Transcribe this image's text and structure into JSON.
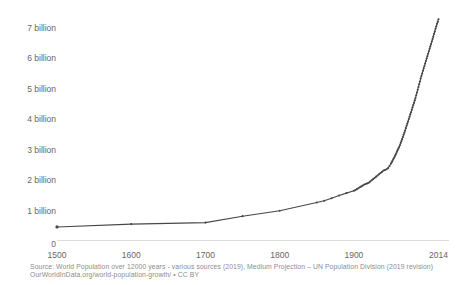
{
  "chart_data": {
    "type": "line",
    "title": "",
    "xlabel": "",
    "ylabel": "",
    "x_range": [
      1500,
      2014
    ],
    "y_range": [
      0,
      7.5
    ],
    "grid": false,
    "legend": "none",
    "line_color": "#474747",
    "marker_color": "#474747",
    "axis_line_color": "#dcdcdc",
    "tick_label_color": "#666666",
    "x": [
      1500,
      1600,
      1700,
      1750,
      1800,
      1850,
      1860,
      1870,
      1880,
      1890,
      1900,
      1902,
      1904,
      1906,
      1908,
      1910,
      1912,
      1914,
      1916,
      1918,
      1920,
      1922,
      1924,
      1926,
      1928,
      1930,
      1932,
      1934,
      1936,
      1938,
      1940,
      1942,
      1944,
      1946,
      1948,
      1950,
      1951,
      1952,
      1953,
      1954,
      1955,
      1956,
      1957,
      1958,
      1959,
      1960,
      1961,
      1962,
      1963,
      1964,
      1965,
      1966,
      1967,
      1968,
      1969,
      1970,
      1971,
      1972,
      1973,
      1974,
      1975,
      1976,
      1977,
      1978,
      1979,
      1980,
      1981,
      1982,
      1983,
      1984,
      1985,
      1986,
      1987,
      1988,
      1989,
      1990,
      1991,
      1992,
      1993,
      1994,
      1995,
      1996,
      1997,
      1998,
      1999,
      2000,
      2001,
      2002,
      2003,
      2004,
      2005,
      2006,
      2007,
      2008,
      2009,
      2010,
      2011,
      2012,
      2013,
      2014
    ],
    "series": [
      {
        "name": "World population (billions)",
        "values": [
          0.461,
          0.554,
          0.603,
          0.814,
          0.99,
          1.263,
          1.32,
          1.4,
          1.49,
          1.57,
          1.65,
          1.67,
          1.7,
          1.73,
          1.76,
          1.79,
          1.82,
          1.85,
          1.87,
          1.89,
          1.91,
          1.95,
          1.99,
          2.03,
          2.07,
          2.11,
          2.15,
          2.19,
          2.23,
          2.27,
          2.31,
          2.33,
          2.35,
          2.39,
          2.46,
          2.54,
          2.58,
          2.63,
          2.68,
          2.72,
          2.77,
          2.82,
          2.87,
          2.93,
          2.98,
          3.03,
          3.08,
          3.14,
          3.21,
          3.27,
          3.34,
          3.41,
          3.48,
          3.55,
          3.62,
          3.7,
          3.78,
          3.85,
          3.92,
          4.0,
          4.07,
          4.15,
          4.22,
          4.3,
          4.38,
          4.46,
          4.53,
          4.61,
          4.69,
          4.78,
          4.87,
          4.96,
          5.05,
          5.14,
          5.23,
          5.33,
          5.41,
          5.49,
          5.58,
          5.66,
          5.74,
          5.82,
          5.9,
          5.98,
          6.06,
          6.14,
          6.22,
          6.3,
          6.38,
          6.46,
          6.54,
          6.62,
          6.7,
          6.79,
          6.87,
          6.96,
          7.04,
          7.12,
          7.19,
          7.27
        ]
      }
    ],
    "y_ticks": [
      {
        "value": 0,
        "label": "0"
      },
      {
        "value": 1,
        "label": "1 billion"
      },
      {
        "value": 2,
        "label": "2 billion"
      },
      {
        "value": 3,
        "label": "3 billion"
      },
      {
        "value": 4,
        "label": "4 billion"
      },
      {
        "value": 5,
        "label": "5 billion"
      },
      {
        "value": 6,
        "label": "6 billion"
      },
      {
        "value": 7,
        "label": "7 billion"
      }
    ],
    "x_ticks": [
      {
        "value": 1500,
        "label": "1500"
      },
      {
        "value": 1600,
        "label": "1600"
      },
      {
        "value": 1700,
        "label": "1700"
      },
      {
        "value": 1800,
        "label": "1800"
      },
      {
        "value": 1900,
        "label": "1900"
      },
      {
        "value": 2014,
        "label": "2014"
      }
    ]
  },
  "source": {
    "line1": "Source: World Population over 12000 years - various sources (2019), Medium Projection – UN Population Division (2019 revision)",
    "line2": "OurWorldInData.org/world-population-growth/ • CC BY"
  }
}
